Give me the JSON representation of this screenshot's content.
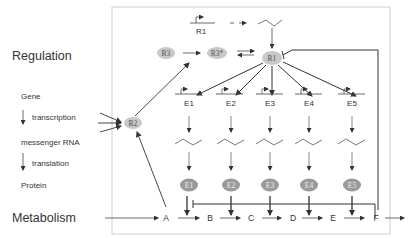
{
  "diagram": {
    "section_labels": {
      "regulation": "Regulation",
      "metabolism": "Metabolism"
    },
    "legend": {
      "gene": "Gene",
      "transcription": "transcription",
      "mrna": "messenger RNA",
      "translation": "translation",
      "protein": "Protein"
    },
    "regulators": {
      "r1_gene": "R1",
      "r1": "R1",
      "r2": "R2",
      "r3": "R3",
      "r3_active": "R3*"
    },
    "genes": [
      "E1",
      "E2",
      "E3",
      "E4",
      "E5"
    ],
    "enzymes": [
      "E1",
      "E2",
      "E3",
      "E4",
      "E5"
    ],
    "metabolites": [
      "A",
      "B",
      "C",
      "D",
      "E",
      "F"
    ],
    "colors": {
      "node_fill": "#c8c8c8",
      "enzyme_fill": "#9a9a9a",
      "line": "#333333",
      "frame": "#d0d0d0"
    }
  }
}
